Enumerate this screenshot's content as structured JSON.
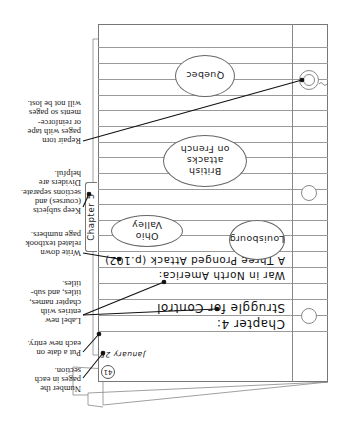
{
  "orientation": "rotated-180",
  "notebook": {
    "page_number": "41",
    "date": "January 25",
    "heading": {
      "chapter": "Chapter 4:",
      "chapter_title": "Struggle for Control",
      "subtitle": "War in North America:",
      "subsection": "A Three Pronged Attack (p.102)"
    },
    "ovals": [
      {
        "label": "Ohio Valley"
      },
      {
        "label": "Louisbourg"
      },
      {
        "label": "British attacks on French"
      },
      {
        "label": "Quebec"
      }
    ],
    "divider_tab": {
      "label": "Chapter 5"
    }
  },
  "annotations": [
    {
      "id": "number-pages",
      "text": "Number the\npages in each\nsection."
    },
    {
      "id": "date-entry",
      "text": "Put a date on\neach new entry."
    },
    {
      "id": "label-entries",
      "text": "Label new\nentries with\nchapter names,\ntitles, and sub-\ntitles."
    },
    {
      "id": "page-numbers",
      "text": "Write down\nrelated textbook\npage numbers."
    },
    {
      "id": "dividers",
      "text": "Keep subjects\n(courses) and\nsections separate.\nDividers are\nhelpful."
    },
    {
      "id": "repair",
      "text": "Repair torn\npages with tape\nor reinforce-\nments so pages\nwill not be lost."
    }
  ],
  "colors": {
    "line": "#9a9a9a",
    "ink": "#111111",
    "border": "#777777"
  }
}
